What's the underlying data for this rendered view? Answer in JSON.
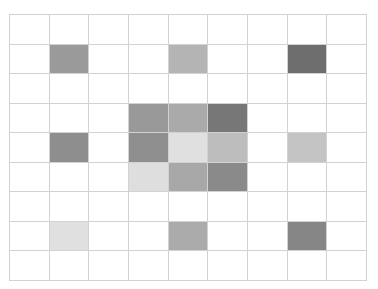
{
  "chart_data": {
    "type": "heatmap",
    "title": "",
    "xlabel": "",
    "ylabel": "",
    "rows": 9,
    "cols": 9,
    "grid": true,
    "legend": null,
    "values": [
      [
        0,
        0,
        0,
        0,
        0,
        0,
        0,
        0,
        0
      ],
      [
        0,
        0.45,
        0,
        0,
        0.35,
        0,
        0,
        0.65,
        0
      ],
      [
        0,
        0,
        0,
        0,
        0,
        0,
        0,
        0,
        0
      ],
      [
        0,
        0,
        0,
        0.45,
        0.4,
        0.6,
        0,
        0,
        0
      ],
      [
        0,
        0.5,
        0,
        0.5,
        0.15,
        0.3,
        0,
        0.28,
        0
      ],
      [
        0,
        0,
        0,
        0.15,
        0.4,
        0.52,
        0,
        0,
        0
      ],
      [
        0,
        0,
        0,
        0,
        0,
        0,
        0,
        0,
        0
      ],
      [
        0,
        0.15,
        0,
        0,
        0.4,
        0,
        0,
        0.55,
        0
      ],
      [
        0,
        0,
        0,
        0,
        0,
        0,
        0,
        0,
        0
      ]
    ],
    "colors": [
      [
        "#ffffff",
        "#ffffff",
        "#ffffff",
        "#ffffff",
        "#ffffff",
        "#ffffff",
        "#ffffff",
        "#ffffff",
        "#ffffff"
      ],
      [
        "#ffffff",
        "#9a9a9a",
        "#ffffff",
        "#ffffff",
        "#b4b4b4",
        "#ffffff",
        "#ffffff",
        "#6e6e6e",
        "#ffffff"
      ],
      [
        "#ffffff",
        "#ffffff",
        "#ffffff",
        "#ffffff",
        "#ffffff",
        "#ffffff",
        "#ffffff",
        "#ffffff",
        "#ffffff"
      ],
      [
        "#ffffff",
        "#ffffff",
        "#ffffff",
        "#999999",
        "#aaaaaa",
        "#777777",
        "#ffffff",
        "#ffffff",
        "#ffffff"
      ],
      [
        "#ffffff",
        "#8e8e8e",
        "#ffffff",
        "#8f8f8f",
        "#e0e0e0",
        "#bdbdbd",
        "#ffffff",
        "#c4c4c4",
        "#ffffff"
      ],
      [
        "#ffffff",
        "#ffffff",
        "#ffffff",
        "#dedede",
        "#a8a8a8",
        "#8a8a8a",
        "#ffffff",
        "#ffffff",
        "#ffffff"
      ],
      [
        "#ffffff",
        "#ffffff",
        "#ffffff",
        "#ffffff",
        "#ffffff",
        "#ffffff",
        "#ffffff",
        "#ffffff",
        "#ffffff"
      ],
      [
        "#ffffff",
        "#e0e0e0",
        "#ffffff",
        "#ffffff",
        "#ababab",
        "#ffffff",
        "#ffffff",
        "#868686",
        "#ffffff"
      ],
      [
        "#ffffff",
        "#ffffff",
        "#ffffff",
        "#ffffff",
        "#ffffff",
        "#ffffff",
        "#ffffff",
        "#ffffff",
        "#ffffff"
      ]
    ],
    "grid_color": "#d2d2d2"
  }
}
